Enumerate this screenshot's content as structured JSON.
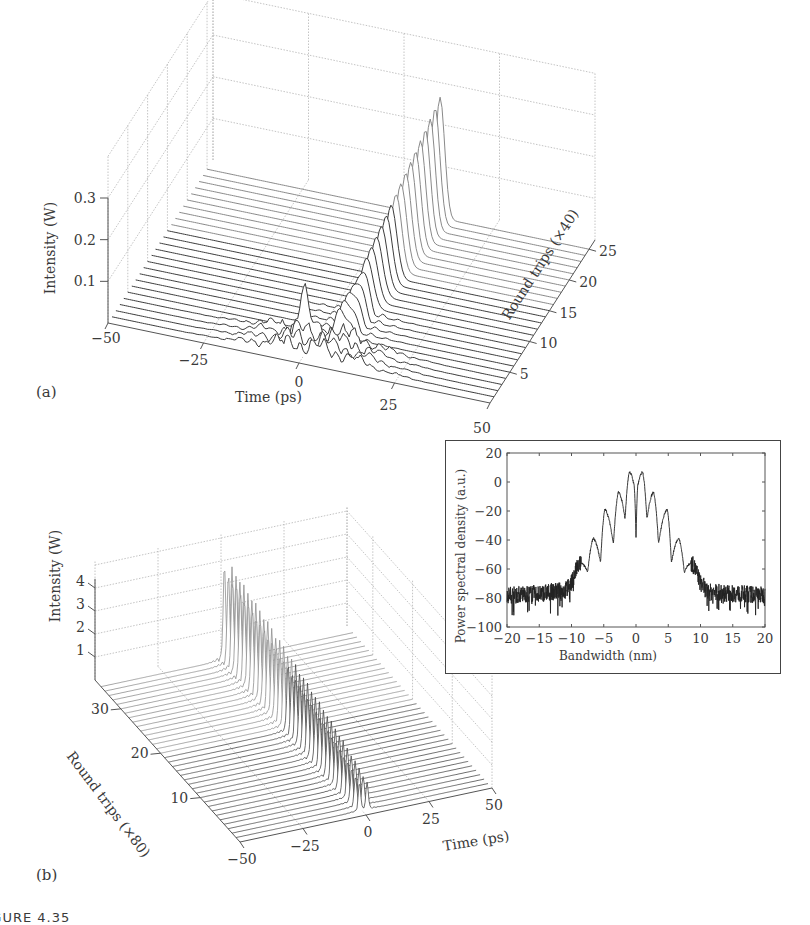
{
  "figure": {
    "caption_fragment": "FIGURE 4.35"
  },
  "chart_data": [
    {
      "id": "panel_a",
      "panel_label": "(a)",
      "type": "waterfall3d",
      "title": "",
      "xlabel": "Time (ps)",
      "ylabel": "Round trips (×40)",
      "zlabel": "Intensity (W)",
      "x_ticks": [
        -50,
        -25,
        0,
        25,
        50
      ],
      "y_ticks": [
        5,
        10,
        15,
        20,
        25
      ],
      "z_ticks": [
        0.1,
        0.2,
        0.3
      ],
      "xlim": [
        -50,
        50
      ],
      "ylim": [
        0,
        25
      ],
      "zlim": [
        0,
        0.3
      ],
      "grid": true,
      "n_traces": 25,
      "description": "Noisy multi-peak structure at early round trips evolves into a single pulse near t≈10 ps whose peak grows to ~0.3 W by round trip 25",
      "series_summary": [
        {
          "round_trip": 1,
          "peak_time_ps": 5,
          "peak_intensity_W": 0.02,
          "noisy": true
        },
        {
          "round_trip": 3,
          "peak_time_ps": 6,
          "peak_intensity_W": 0.04,
          "noisy": true
        },
        {
          "round_trip": 5,
          "peak_time_ps": 7,
          "peak_intensity_W": 0.08,
          "noisy": true
        },
        {
          "round_trip": 10,
          "peak_time_ps": 8,
          "peak_intensity_W": 0.14,
          "noisy": false
        },
        {
          "round_trip": 15,
          "peak_time_ps": 9,
          "peak_intensity_W": 0.19,
          "noisy": false
        },
        {
          "round_trip": 20,
          "peak_time_ps": 10,
          "peak_intensity_W": 0.24,
          "noisy": false
        },
        {
          "round_trip": 25,
          "peak_time_ps": 11,
          "peak_intensity_W": 0.28,
          "noisy": false
        }
      ]
    },
    {
      "id": "panel_b",
      "panel_label": "(b)",
      "type": "waterfall3d",
      "title": "",
      "xlabel": "Time (ps)",
      "ylabel": "Round trips (×80)",
      "zlabel": "Intensity (W)",
      "x_ticks": [
        -50,
        -25,
        0,
        25,
        50
      ],
      "y_ticks": [
        10,
        20,
        30
      ],
      "z_ticks": [
        1,
        2,
        3,
        4
      ],
      "xlim": [
        -50,
        50
      ],
      "ylim": [
        0,
        35
      ],
      "zlim": [
        0,
        4
      ],
      "grid": true,
      "n_traces": 35,
      "description": "Bound twin-pulse state near t≈0 ps with peak intensity ~3.5–4 W, stable over round trips",
      "series_summary": [
        {
          "round_trip": 1,
          "pulse_times_ps": [
            -1,
            2
          ],
          "peak_intensity_W": 1.2
        },
        {
          "round_trip": 10,
          "pulse_times_ps": [
            -1,
            2
          ],
          "peak_intensity_W": 2.5
        },
        {
          "round_trip": 20,
          "pulse_times_ps": [
            -1,
            2
          ],
          "peak_intensity_W": 3.2
        },
        {
          "round_trip": 30,
          "pulse_times_ps": [
            -1,
            2
          ],
          "peak_intensity_W": 3.7
        },
        {
          "round_trip": 35,
          "pulse_times_ps": [
            -1,
            2
          ],
          "peak_intensity_W": 3.9
        }
      ]
    },
    {
      "id": "panel_b_inset",
      "type": "line",
      "title": "",
      "xlabel": "Bandwidth (nm)",
      "ylabel": "Power spectral density (a.u.)",
      "x_ticks": [
        -20,
        -15,
        -10,
        -5,
        0,
        5,
        10,
        15,
        20
      ],
      "y_ticks": [
        20,
        0,
        -20,
        -40,
        -60,
        -80,
        -100
      ],
      "xlim": [
        -20,
        20
      ],
      "ylim": [
        -100,
        20
      ],
      "grid": false,
      "series": [
        {
          "name": "spectrum",
          "x": [
            -20,
            -15,
            -11,
            -10,
            -8.5,
            -7.5,
            -6.6,
            -5.5,
            -4.8,
            -3.5,
            -2.7,
            -1.7,
            -1.0,
            -0.3,
            0,
            0.3,
            1.0,
            1.7,
            2.7,
            3.5,
            4.8,
            5.5,
            6.6,
            7.5,
            8.5,
            10,
            11,
            15,
            20
          ],
          "values": [
            -78,
            -77,
            -75,
            -70,
            -56,
            -62,
            -39,
            -55,
            -19,
            -42,
            -7,
            -25,
            7,
            -2,
            -38,
            -2,
            7,
            -25,
            -7,
            -42,
            -19,
            -55,
            -39,
            -62,
            -56,
            -70,
            -76,
            -77,
            -78
          ]
        }
      ],
      "annotations": [
        "central spectral dip at 0 nm",
        "symmetric sidelobes",
        "noise floor ≈ -75 to -80"
      ]
    }
  ],
  "inset_labels": {
    "xlabel": "Bandwidth (nm)",
    "ylabel": "Power spectral density (a.u.)",
    "x_ticks": [
      "−20",
      "−15",
      "−10",
      "−5",
      "0",
      "5",
      "10",
      "15",
      "20"
    ],
    "y_ticks": [
      "20",
      "0",
      "−20",
      "−40",
      "−60",
      "−80",
      "−100"
    ]
  },
  "panel_a_labels": {
    "panel": "(a)",
    "xlabel": "Time (ps)",
    "ylabel": "Round trips (×40)",
    "zlabel": "Intensity (W)",
    "x_ticks": [
      "−50",
      "−25",
      "0",
      "25",
      "50"
    ],
    "y_ticks": [
      "5",
      "10",
      "15",
      "20",
      "25"
    ],
    "z_ticks": [
      "0.1",
      "0.2",
      "0.3"
    ]
  },
  "panel_b_labels": {
    "panel": "(b)",
    "xlabel": "Time (ps)",
    "ylabel": "Round trips (×80)",
    "zlabel": "Intensity (W)",
    "x_ticks": [
      "−50",
      "−25",
      "0",
      "25",
      "50"
    ],
    "y_ticks": [
      "10",
      "20",
      "30"
    ],
    "z_ticks": [
      "1",
      "2",
      "3",
      "4"
    ]
  },
  "colors": {
    "trace": "#3c3c3c",
    "trace_light": "#9a9a9a",
    "grid": "#b5b5b5",
    "axis": "#555555",
    "inset_frame": "#444444"
  }
}
